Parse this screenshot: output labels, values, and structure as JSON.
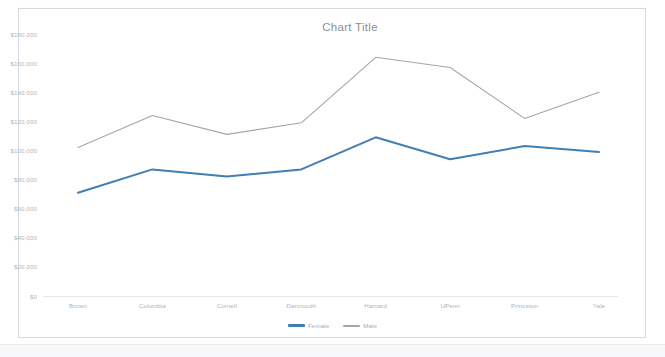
{
  "chart_frame": {
    "border_color": "#d6d9dd",
    "background": "#ffffff"
  },
  "chart_data": {
    "type": "line",
    "title": "Chart Title",
    "xlabel": "",
    "ylabel": "",
    "categories": [
      "Brown",
      "Columbia",
      "Cornell",
      "Dartmouth",
      "Harvard",
      "UPenn",
      "Princeton",
      "Yale"
    ],
    "series": [
      {
        "name": "Female",
        "color": "#3f7fb5",
        "values": [
          71000,
          87000,
          82000,
          87000,
          109000,
          94000,
          103000,
          99000
        ]
      },
      {
        "name": "Male",
        "color": "#a6a6a6",
        "values": [
          102000,
          124000,
          111000,
          119000,
          164000,
          157000,
          122000,
          140000
        ]
      }
    ],
    "ylim": [
      0,
      190000
    ],
    "y_ticks": [
      0,
      20000,
      40000,
      60000,
      80000,
      100000,
      120000,
      140000,
      160000,
      180000
    ],
    "y_tick_labels": [
      "$0",
      "$20,000",
      "$40,000",
      "$60,000",
      "$80,000",
      "$100,000",
      "$120,000",
      "$140,000",
      "$160,000",
      "$180,000"
    ],
    "grid": false,
    "legend_position": "bottom",
    "legend_entries": [
      "Female",
      "Male"
    ]
  }
}
